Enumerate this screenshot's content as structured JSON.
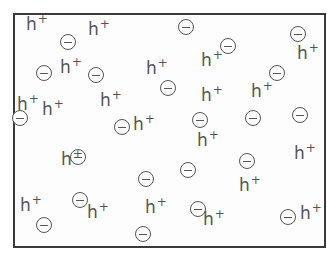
{
  "diagram": {
    "frame": {
      "left": 13,
      "top": 13,
      "width": 309,
      "height": 231,
      "border_color": "#3a3a3a"
    },
    "colors": {
      "glyph": "#555555",
      "background": "#ffffff"
    },
    "hole_label": {
      "base": "h",
      "charge": "+"
    },
    "electron_symbol": "minus-in-circle",
    "holes": [
      {
        "x": 26,
        "y": 16
      },
      {
        "x": 88,
        "y": 21
      },
      {
        "x": 60,
        "y": 59
      },
      {
        "x": 146,
        "y": 60
      },
      {
        "x": 201,
        "y": 52
      },
      {
        "x": 297,
        "y": 45
      },
      {
        "x": 17,
        "y": 96
      },
      {
        "x": 42,
        "y": 101
      },
      {
        "x": 100,
        "y": 92
      },
      {
        "x": 201,
        "y": 87
      },
      {
        "x": 251,
        "y": 83
      },
      {
        "x": 133,
        "y": 116
      },
      {
        "x": 197,
        "y": 132
      },
      {
        "x": 61,
        "y": 151
      },
      {
        "x": 294,
        "y": 145
      },
      {
        "x": 239,
        "y": 177
      },
      {
        "x": 20,
        "y": 197
      },
      {
        "x": 87,
        "y": 204
      },
      {
        "x": 145,
        "y": 199
      },
      {
        "x": 203,
        "y": 211
      },
      {
        "x": 300,
        "y": 205
      }
    ],
    "electrons": [
      {
        "x": 60,
        "y": 34
      },
      {
        "x": 178,
        "y": 19
      },
      {
        "x": 290,
        "y": 26
      },
      {
        "x": 220,
        "y": 38
      },
      {
        "x": 36,
        "y": 65
      },
      {
        "x": 88,
        "y": 67
      },
      {
        "x": 160,
        "y": 80
      },
      {
        "x": 269,
        "y": 65
      },
      {
        "x": 12,
        "y": 110
      },
      {
        "x": 114,
        "y": 119
      },
      {
        "x": 192,
        "y": 112
      },
      {
        "x": 245,
        "y": 110
      },
      {
        "x": 292,
        "y": 107
      },
      {
        "x": 70,
        "y": 149
      },
      {
        "x": 239,
        "y": 153
      },
      {
        "x": 138,
        "y": 171
      },
      {
        "x": 180,
        "y": 162
      },
      {
        "x": 72,
        "y": 192
      },
      {
        "x": 190,
        "y": 201
      },
      {
        "x": 280,
        "y": 209
      },
      {
        "x": 36,
        "y": 217
      },
      {
        "x": 135,
        "y": 226
      }
    ]
  }
}
